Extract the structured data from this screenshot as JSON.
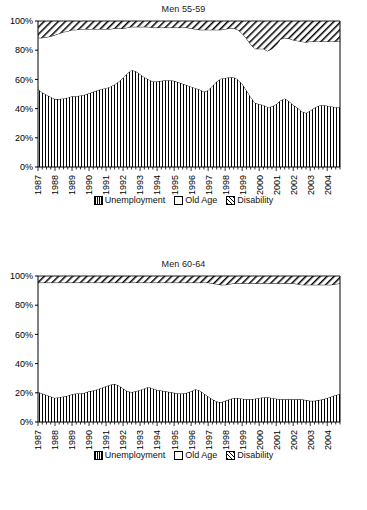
{
  "figure": {
    "background": "#ffffff",
    "line_color": "#000000"
  },
  "legend": {
    "items": [
      {
        "label": "Unemployment",
        "pattern": "vertical-hatch",
        "icon": "legend-swatch-unemployment"
      },
      {
        "label": "Old Age",
        "pattern": "solid-white",
        "icon": "legend-swatch-old-age"
      },
      {
        "label": "Disability",
        "pattern": "diagonal-hatch",
        "icon": "legend-swatch-disability"
      }
    ]
  },
  "panels": [
    {
      "title": "Men 55-59",
      "chart_index": 0
    },
    {
      "title": "Men 60-64",
      "chart_index": 1
    }
  ],
  "chart_data": [
    {
      "type": "area",
      "stacked": true,
      "title": "Men 55-59",
      "xlabel": "",
      "ylabel": "",
      "ylim": [
        0,
        100
      ],
      "yticks": [
        0,
        20,
        40,
        60,
        80,
        100
      ],
      "ytick_labels": [
        "0%",
        "20%",
        "40%",
        "60%",
        "80%",
        "100%"
      ],
      "grid": false,
      "legend_position": "bottom",
      "x_tick_labels": [
        "1987",
        "1988",
        "1989",
        "1990",
        "1991",
        "1992",
        "1993",
        "1994",
        "1995",
        "1996",
        "1997",
        "1998",
        "1999",
        "2000",
        "2001",
        "2002",
        "2003",
        "2004"
      ],
      "x_start": 1987,
      "x_end": 2004.75,
      "x_period": "quarterly",
      "x": [
        1987.0,
        1987.25,
        1987.5,
        1987.75,
        1988.0,
        1988.25,
        1988.5,
        1988.75,
        1989.0,
        1989.25,
        1989.5,
        1989.75,
        1990.0,
        1990.25,
        1990.5,
        1990.75,
        1991.0,
        1991.25,
        1991.5,
        1991.75,
        1992.0,
        1992.25,
        1992.5,
        1992.75,
        1993.0,
        1993.25,
        1993.5,
        1993.75,
        1994.0,
        1994.25,
        1994.5,
        1994.75,
        1995.0,
        1995.25,
        1995.5,
        1995.75,
        1996.0,
        1996.25,
        1996.5,
        1996.75,
        1997.0,
        1997.25,
        1997.5,
        1997.75,
        1998.0,
        1998.25,
        1998.5,
        1998.75,
        1999.0,
        1999.25,
        1999.5,
        1999.75,
        2000.0,
        2000.25,
        2000.5,
        2000.75,
        2001.0,
        2001.25,
        2001.5,
        2001.75,
        2002.0,
        2002.25,
        2002.5,
        2002.75,
        2003.0,
        2003.25,
        2003.5,
        2003.75,
        2004.0,
        2004.25,
        2004.5,
        2004.75
      ],
      "series": [
        {
          "name": "Unemployment",
          "pattern": "vertical-hatch",
          "values": [
            53.5,
            51.0,
            49.5,
            48.0,
            46.5,
            46.5,
            47.0,
            47.5,
            48.5,
            48.5,
            49.0,
            49.5,
            50.5,
            51.5,
            52.5,
            53.5,
            54.0,
            55.0,
            56.5,
            58.5,
            61.0,
            64.0,
            66.5,
            65.5,
            63.5,
            61.5,
            60.0,
            58.5,
            58.5,
            59.0,
            59.5,
            59.5,
            59.0,
            58.0,
            57.0,
            56.0,
            55.0,
            54.0,
            53.0,
            51.5,
            52.5,
            55.5,
            58.5,
            60.5,
            61.0,
            61.5,
            61.5,
            60.0,
            57.0,
            52.5,
            48.0,
            44.0,
            43.0,
            42.5,
            41.0,
            41.5,
            43.0,
            45.5,
            47.0,
            45.0,
            42.5,
            40.5,
            38.0,
            37.0,
            38.5,
            40.5,
            42.0,
            42.5,
            42.0,
            41.5,
            41.0,
            41.0
          ]
        },
        {
          "name": "Old Age",
          "pattern": "solid-white",
          "values": [
            35.0,
            37.5,
            39.5,
            41.5,
            44.0,
            45.0,
            45.5,
            45.5,
            45.5,
            45.5,
            45.5,
            45.0,
            44.0,
            43.0,
            42.0,
            41.0,
            40.5,
            39.5,
            38.5,
            36.5,
            34.0,
            31.5,
            29.5,
            30.5,
            32.5,
            34.5,
            36.0,
            37.0,
            37.0,
            36.5,
            36.0,
            36.0,
            36.5,
            37.5,
            38.5,
            39.5,
            40.0,
            40.5,
            41.0,
            42.5,
            41.5,
            38.5,
            35.5,
            33.5,
            33.5,
            33.5,
            33.5,
            34.0,
            34.5,
            35.5,
            36.0,
            37.0,
            38.0,
            38.5,
            38.5,
            39.5,
            40.5,
            42.0,
            41.5,
            43.0,
            44.5,
            46.0,
            48.0,
            48.5,
            47.5,
            45.5,
            44.0,
            43.5,
            44.0,
            44.5,
            45.0,
            45.0
          ]
        },
        {
          "name": "Disability",
          "pattern": "diagonal-hatch",
          "values": [
            11.5,
            11.5,
            11.0,
            10.5,
            9.5,
            8.5,
            7.5,
            7.0,
            6.0,
            6.0,
            5.5,
            5.5,
            5.5,
            5.5,
            5.5,
            5.5,
            5.5,
            5.5,
            5.0,
            5.0,
            5.0,
            4.5,
            4.0,
            4.0,
            4.0,
            4.0,
            4.0,
            4.5,
            4.5,
            4.5,
            4.5,
            4.5,
            4.5,
            4.5,
            4.5,
            4.5,
            5.0,
            5.5,
            6.0,
            6.0,
            6.0,
            6.0,
            6.0,
            6.0,
            5.5,
            5.0,
            5.0,
            6.0,
            8.5,
            12.0,
            16.0,
            19.0,
            19.0,
            19.0,
            20.5,
            19.0,
            16.5,
            12.5,
            11.5,
            12.0,
            13.0,
            13.5,
            14.0,
            14.5,
            14.0,
            14.0,
            14.0,
            14.0,
            14.0,
            14.0,
            14.0,
            14.0
          ]
        }
      ]
    },
    {
      "type": "area",
      "stacked": true,
      "title": "Men 60-64",
      "xlabel": "",
      "ylabel": "",
      "ylim": [
        0,
        100
      ],
      "yticks": [
        0,
        20,
        40,
        60,
        80,
        100
      ],
      "ytick_labels": [
        "0%",
        "20%",
        "40%",
        "60%",
        "80%",
        "100%"
      ],
      "grid": false,
      "legend_position": "bottom",
      "x_tick_labels": [
        "1987",
        "1988",
        "1989",
        "1990",
        "1991",
        "1992",
        "1993",
        "1994",
        "1995",
        "1996",
        "1997",
        "1998",
        "1999",
        "2000",
        "2001",
        "2002",
        "2003",
        "2004"
      ],
      "x_start": 1987,
      "x_end": 2004.75,
      "x_period": "quarterly",
      "x": [
        1987.0,
        1987.25,
        1987.5,
        1987.75,
        1988.0,
        1988.25,
        1988.5,
        1988.75,
        1989.0,
        1989.25,
        1989.5,
        1989.75,
        1990.0,
        1990.25,
        1990.5,
        1990.75,
        1991.0,
        1991.25,
        1991.5,
        1991.75,
        1992.0,
        1992.25,
        1992.5,
        1992.75,
        1993.0,
        1993.25,
        1993.5,
        1993.75,
        1994.0,
        1994.25,
        1994.5,
        1994.75,
        1995.0,
        1995.25,
        1995.5,
        1995.75,
        1996.0,
        1996.25,
        1996.5,
        1996.75,
        1997.0,
        1997.25,
        1997.5,
        1997.75,
        1998.0,
        1998.25,
        1998.5,
        1998.75,
        1999.0,
        1999.25,
        1999.5,
        1999.75,
        2000.0,
        2000.25,
        2000.5,
        2000.75,
        2001.0,
        2001.25,
        2001.5,
        2001.75,
        2002.0,
        2002.25,
        2002.5,
        2002.75,
        2003.0,
        2003.25,
        2003.5,
        2003.75,
        2004.0,
        2004.25,
        2004.5,
        2004.75
      ],
      "series": [
        {
          "name": "Unemployment",
          "pattern": "vertical-hatch",
          "values": [
            20.5,
            19.5,
            18.5,
            17.5,
            16.5,
            17.0,
            17.5,
            18.0,
            19.0,
            19.5,
            19.5,
            20.0,
            21.0,
            21.5,
            22.5,
            23.5,
            24.5,
            25.5,
            26.0,
            25.0,
            23.0,
            21.0,
            20.5,
            21.0,
            22.0,
            23.0,
            24.0,
            23.0,
            22.0,
            21.5,
            21.0,
            20.5,
            20.0,
            19.5,
            19.5,
            20.0,
            21.0,
            22.5,
            21.5,
            19.5,
            17.5,
            15.5,
            14.0,
            13.5,
            14.5,
            15.5,
            16.5,
            16.5,
            16.0,
            15.5,
            15.5,
            16.0,
            16.5,
            17.0,
            17.0,
            16.5,
            16.0,
            15.5,
            15.5,
            15.5,
            15.5,
            15.5,
            15.5,
            15.0,
            14.5,
            14.5,
            15.0,
            15.5,
            16.5,
            17.5,
            18.5,
            19.0
          ]
        },
        {
          "name": "Old Age",
          "pattern": "solid-white",
          "values": [
            75.0,
            76.0,
            77.0,
            78.0,
            79.0,
            78.5,
            78.0,
            77.5,
            76.5,
            76.0,
            76.0,
            75.5,
            74.5,
            74.0,
            73.0,
            72.0,
            71.0,
            70.0,
            69.5,
            70.5,
            72.5,
            74.5,
            75.0,
            74.5,
            73.5,
            72.5,
            71.5,
            72.5,
            73.5,
            74.0,
            74.5,
            75.0,
            75.5,
            76.0,
            76.0,
            75.5,
            74.5,
            73.0,
            74.0,
            76.0,
            78.0,
            79.5,
            80.5,
            80.5,
            79.5,
            79.0,
            78.5,
            78.5,
            79.0,
            79.5,
            79.5,
            79.0,
            78.5,
            78.0,
            78.0,
            78.5,
            79.0,
            79.5,
            79.5,
            79.5,
            79.5,
            79.0,
            78.5,
            79.0,
            79.5,
            79.5,
            79.0,
            78.5,
            77.5,
            76.5,
            76.0,
            76.0
          ]
        },
        {
          "name": "Disability",
          "pattern": "diagonal-hatch",
          "values": [
            4.5,
            4.5,
            4.5,
            4.5,
            4.5,
            4.5,
            4.5,
            4.5,
            4.5,
            4.5,
            4.5,
            4.5,
            4.5,
            4.5,
            4.5,
            4.5,
            4.5,
            4.5,
            4.5,
            4.5,
            4.5,
            4.5,
            4.5,
            4.5,
            4.5,
            4.5,
            4.5,
            4.5,
            4.5,
            4.5,
            4.5,
            4.5,
            4.5,
            4.5,
            4.5,
            4.5,
            4.5,
            4.5,
            4.5,
            4.5,
            4.5,
            5.0,
            5.5,
            6.0,
            6.0,
            5.5,
            5.0,
            5.0,
            5.0,
            5.0,
            5.0,
            5.0,
            5.0,
            5.0,
            5.0,
            5.0,
            5.0,
            5.0,
            5.0,
            5.0,
            5.0,
            5.5,
            6.0,
            6.0,
            6.0,
            6.0,
            6.0,
            6.0,
            6.0,
            6.0,
            5.5,
            5.0
          ]
        }
      ]
    }
  ]
}
